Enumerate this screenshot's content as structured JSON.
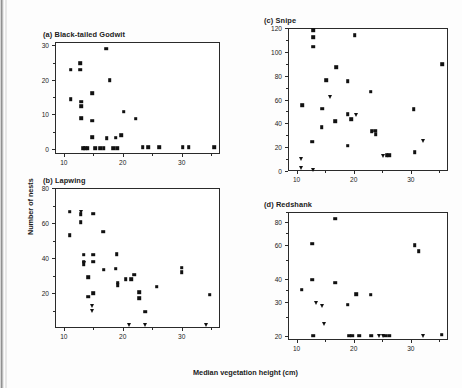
{
  "figure": {
    "xlabel": "Median vegetation height (cm)",
    "ylabel": "Number of nests",
    "marker_color": "#111111",
    "axis_color": "#2a2a2a"
  },
  "chart_data": [
    {
      "type": "scatter",
      "title": "(a) Black-tailed Godwit",
      "xlabel": "Median vegetation height (cm)",
      "ylabel": "Number of nests",
      "xlim": [
        8.5,
        36.5
      ],
      "ylim": [
        -1.5,
        31
      ],
      "xticks": [
        10,
        20,
        30
      ],
      "yticks": [
        0,
        10,
        20,
        30
      ],
      "yscale": "linear",
      "grid": false,
      "legend": "none",
      "series": [
        {
          "name": "nests",
          "marker": "square",
          "points": [
            [
              11.0,
              23.3
            ],
            [
              11.0,
              14.7
            ],
            [
              12.6,
              25.2
            ],
            [
              12.6,
              23.3
            ],
            [
              12.8,
              14.0
            ],
            [
              12.8,
              12.6
            ],
            [
              12.8,
              9.2
            ],
            [
              13.1,
              0.4
            ],
            [
              13.5,
              0.4
            ],
            [
              13.9,
              0.4
            ],
            [
              14.6,
              16.5
            ],
            [
              14.6,
              8.4
            ],
            [
              14.6,
              3.6
            ],
            [
              15.2,
              0.4
            ],
            [
              16.0,
              0.4
            ],
            [
              16.6,
              0.4
            ],
            [
              17.0,
              29.3
            ],
            [
              17.1,
              3.4
            ],
            [
              17.6,
              20.2
            ],
            [
              18.2,
              0.4
            ],
            [
              18.9,
              0.4
            ],
            [
              18.6,
              3.5
            ],
            [
              19.6,
              4.2
            ],
            [
              20.0,
              11.1
            ],
            [
              22.0,
              9.0
            ],
            [
              23.2,
              0.8
            ],
            [
              24.1,
              0.8
            ],
            [
              26.0,
              0.8
            ],
            [
              30.0,
              0.8
            ],
            [
              31.0,
              0.8
            ],
            [
              35.3,
              0.8
            ]
          ]
        }
      ]
    },
    {
      "type": "scatter",
      "title": "(b) Lapwing",
      "xlabel": "Median vegetation height (cm)",
      "ylabel": "Number of nests",
      "xlim": [
        8.5,
        36.5
      ],
      "ylim": [
        0,
        80
      ],
      "xticks": [
        10,
        20,
        30
      ],
      "yticks": [
        20,
        40,
        60,
        80
      ],
      "yscale": "linear",
      "grid": false,
      "legend": "none",
      "series": [
        {
          "name": "nests-square",
          "marker": "square",
          "points": [
            [
              10.8,
              67.0
            ],
            [
              10.8,
              53.5
            ],
            [
              12.7,
              65.5
            ],
            [
              12.7,
              61.0
            ],
            [
              13.2,
              42.5
            ],
            [
              13.2,
              38.5
            ],
            [
              13.2,
              37.0
            ],
            [
              14.0,
              29.5
            ],
            [
              14.0,
              18.5
            ],
            [
              14.8,
              66.0
            ],
            [
              14.8,
              42.5
            ],
            [
              14.8,
              38.5
            ],
            [
              14.8,
              20.5
            ],
            [
              16.5,
              55.5
            ],
            [
              16.6,
              34.0
            ],
            [
              18.8,
              42.8
            ],
            [
              18.6,
              34.5
            ],
            [
              19.0,
              26.5
            ],
            [
              19.0,
              25.0
            ],
            [
              20.3,
              28.5
            ],
            [
              21.3,
              28.5
            ],
            [
              21.8,
              31.0
            ],
            [
              22.6,
              21.0
            ],
            [
              22.6,
              17.5
            ],
            [
              23.6,
              10.0
            ],
            [
              25.6,
              24.2
            ],
            [
              29.8,
              35.0
            ],
            [
              29.8,
              32.5
            ],
            [
              34.6,
              19.5
            ]
          ]
        },
        {
          "name": "nests-triangle",
          "marker": "triangle",
          "points": [
            [
              12.7,
              67.0
            ],
            [
              13.2,
              38.0
            ],
            [
              14.6,
              13.0
            ],
            [
              14.6,
              10.5
            ],
            [
              20.9,
              2.5
            ],
            [
              23.6,
              2.5
            ],
            [
              33.9,
              2.5
            ]
          ]
        }
      ]
    },
    {
      "type": "scatter",
      "title": "(c) Snipe",
      "xlabel": "Median vegetation height (cm)",
      "ylabel": "Number of nests",
      "xlim": [
        8.5,
        36.5
      ],
      "ylim": [
        0,
        120
      ],
      "xticks": [
        10,
        20,
        30
      ],
      "yticks": [
        0,
        20,
        40,
        60,
        80,
        100,
        120
      ],
      "yscale": "linear",
      "grid": false,
      "legend": "none",
      "series": [
        {
          "name": "nests-square",
          "marker": "square",
          "points": [
            [
              10.8,
              56.0
            ],
            [
              12.7,
              119.0
            ],
            [
              12.7,
              113.0
            ],
            [
              12.7,
              105.0
            ],
            [
              12.6,
              25.5
            ],
            [
              14.3,
              53.0
            ],
            [
              14.2,
              37.5
            ],
            [
              15.0,
              77.0
            ],
            [
              16.8,
              88.0
            ],
            [
              16.6,
              42.5
            ],
            [
              18.8,
              76.0
            ],
            [
              18.8,
              48.5
            ],
            [
              19.4,
              44.5
            ],
            [
              18.8,
              22.0
            ],
            [
              20.0,
              115.0
            ],
            [
              22.8,
              67.5
            ],
            [
              23.0,
              34.0
            ],
            [
              23.6,
              34.5
            ],
            [
              23.7,
              31.5
            ],
            [
              25.6,
              14.0
            ],
            [
              26.0,
              14.0
            ],
            [
              30.3,
              52.5
            ],
            [
              30.5,
              16.5
            ],
            [
              35.3,
              90.5
            ]
          ]
        },
        {
          "name": "nests-triangle",
          "marker": "triangle",
          "points": [
            [
              10.6,
              11.0
            ],
            [
              10.6,
              3.0
            ],
            [
              12.7,
              2.0
            ],
            [
              15.6,
              63.0
            ],
            [
              20.3,
              48.0
            ],
            [
              24.9,
              13.5
            ],
            [
              32.0,
              26.0
            ]
          ]
        }
      ]
    },
    {
      "type": "scatter",
      "title": "(d) Redshank",
      "xlabel": "Median vegetation height (cm)",
      "ylabel": "Number of nests",
      "xlim": [
        8.5,
        36.5
      ],
      "ylim": [
        19,
        90
      ],
      "xticks": [
        10,
        20,
        30
      ],
      "yticks": [
        20,
        30,
        40,
        60,
        80
      ],
      "yscale": "log",
      "grid": false,
      "legend": "none",
      "series": [
        {
          "name": "nests-square",
          "marker": "square",
          "points": [
            [
              10.7,
              35.5
            ],
            [
              12.6,
              62.0
            ],
            [
              12.6,
              40.0
            ],
            [
              12.7,
              20.3
            ],
            [
              16.6,
              84.0
            ],
            [
              16.6,
              38.5
            ],
            [
              18.8,
              29.6
            ],
            [
              19.0,
              20.3
            ],
            [
              19.6,
              20.3
            ],
            [
              20.3,
              33.5
            ],
            [
              20.8,
              20.3
            ],
            [
              22.8,
              33.3
            ],
            [
              22.9,
              20.3
            ],
            [
              25.3,
              20.3
            ],
            [
              26.0,
              20.3
            ],
            [
              30.5,
              61.0
            ],
            [
              31.2,
              56.5
            ],
            [
              35.2,
              20.5
            ]
          ]
        },
        {
          "name": "nests-triangle",
          "marker": "triangle",
          "points": [
            [
              13.3,
              30.2
            ],
            [
              14.2,
              29.0
            ],
            [
              14.6,
              23.5
            ],
            [
              24.3,
              20.3
            ],
            [
              25.0,
              20.3
            ],
            [
              32.0,
              20.3
            ]
          ]
        }
      ]
    }
  ]
}
